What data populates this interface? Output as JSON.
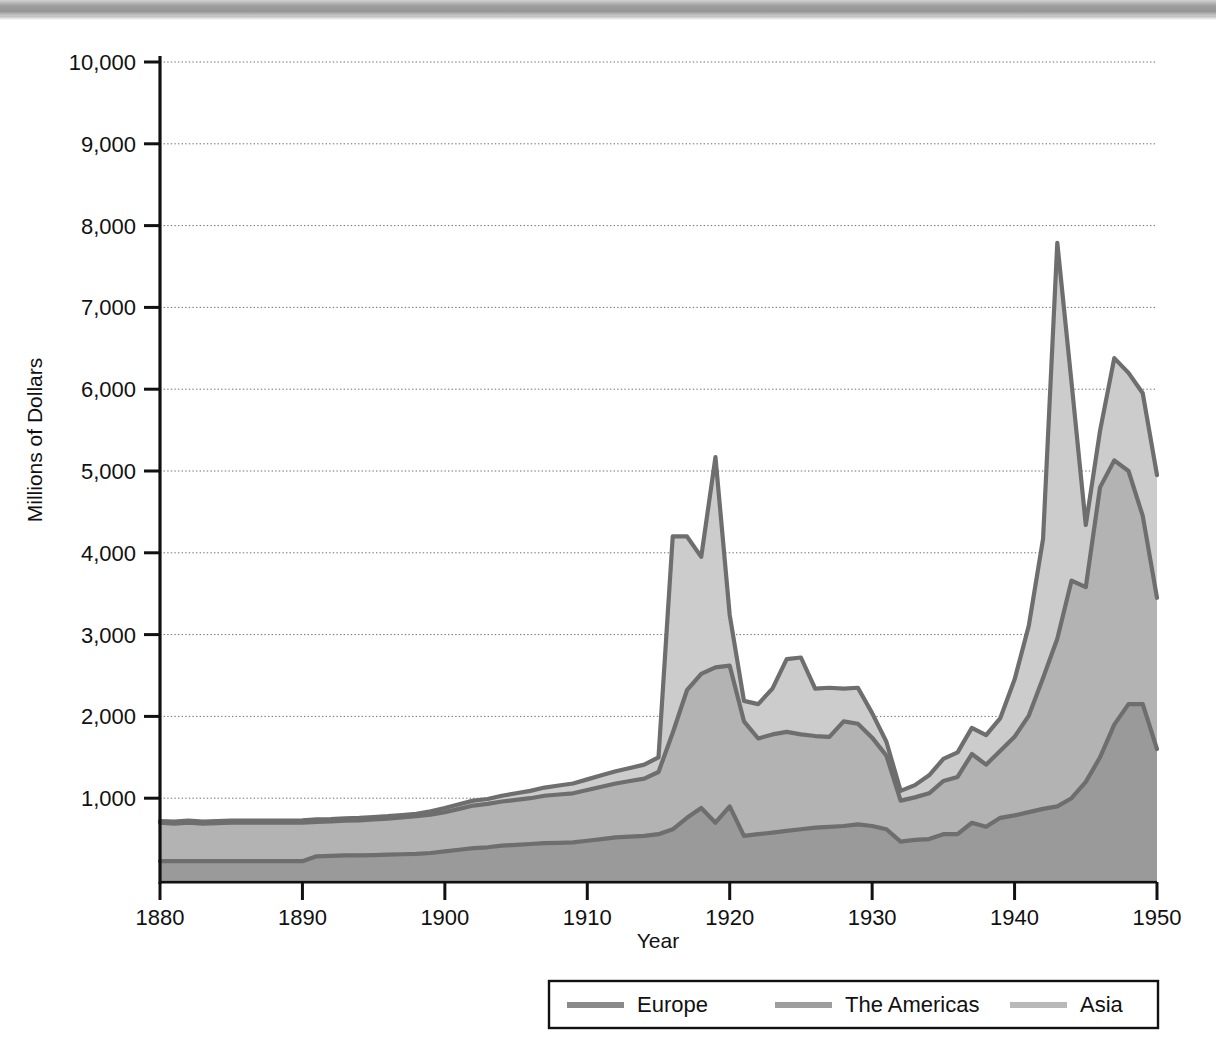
{
  "figure": {
    "type": "stacked-area-chart",
    "scan_artifact": "gray-scan-bar"
  },
  "axes": {
    "y_title": "Millions of Dollars",
    "x_title": "Year",
    "y_ticks": [
      "1,000",
      "2,000",
      "3,000",
      "4,000",
      "5,000",
      "6,000",
      "7,000",
      "8,000",
      "9,000",
      "10,000"
    ],
    "x_ticks": [
      "1880",
      "1890",
      "1900",
      "1910",
      "1920",
      "1930",
      "1940",
      "1950"
    ]
  },
  "legend": {
    "items": [
      {
        "label": "Europe",
        "color": "#8a8a8a"
      },
      {
        "label": "The Americas",
        "color": "#9e9e9e"
      },
      {
        "label": "Asia",
        "color": "#b9b9b9"
      }
    ]
  },
  "colors": {
    "europe_fill": "#9a9a9a",
    "americas_fill": "#b3b3b3",
    "asia_fill": "#cccccc",
    "line": "#6e6e6e",
    "axis": "#111111",
    "grid": "#6f6f6f"
  },
  "chart_data": {
    "type": "area",
    "title": "",
    "subtitle": "",
    "xlabel": "Year",
    "ylabel": "Millions of Dollars",
    "stacked": true,
    "grid": true,
    "legend_position": "bottom",
    "xlim": [
      1880,
      1950
    ],
    "ylim": [
      0,
      10000
    ],
    "ytick_interval": 1000,
    "xtick_interval": 10,
    "x": [
      1880,
      1881,
      1882,
      1883,
      1884,
      1885,
      1886,
      1887,
      1888,
      1889,
      1890,
      1891,
      1892,
      1893,
      1894,
      1895,
      1896,
      1897,
      1898,
      1899,
      1900,
      1901,
      1902,
      1903,
      1904,
      1905,
      1906,
      1907,
      1908,
      1909,
      1910,
      1911,
      1912,
      1913,
      1914,
      1915,
      1916,
      1917,
      1918,
      1919,
      1920,
      1921,
      1922,
      1923,
      1924,
      1925,
      1926,
      1927,
      1928,
      1929,
      1930,
      1931,
      1932,
      1933,
      1934,
      1935,
      1936,
      1937,
      1938,
      1939,
      1940,
      1941,
      1942,
      1943,
      1944,
      1945,
      1946,
      1947,
      1948,
      1949,
      1950
    ],
    "series": [
      {
        "name": "Europe",
        "stack_order": 1,
        "values": [
          230,
          230,
          230,
          230,
          230,
          230,
          230,
          230,
          230,
          230,
          230,
          290,
          295,
          300,
          300,
          305,
          310,
          315,
          320,
          330,
          350,
          370,
          390,
          400,
          420,
          430,
          440,
          450,
          455,
          460,
          480,
          500,
          520,
          530,
          540,
          560,
          620,
          760,
          880,
          700,
          900,
          540,
          560,
          580,
          600,
          620,
          640,
          650,
          660,
          680,
          660,
          620,
          470,
          490,
          500,
          560,
          560,
          700,
          650,
          760,
          790,
          830,
          870,
          900,
          1000,
          1200,
          1500,
          1900,
          2150,
          2150,
          1600
        ]
      },
      {
        "name": "The Americas",
        "stack_order": 2,
        "values": [
          470,
          460,
          470,
          460,
          465,
          470,
          470,
          470,
          470,
          470,
          470,
          420,
          420,
          425,
          430,
          435,
          440,
          450,
          460,
          470,
          480,
          500,
          520,
          530,
          540,
          550,
          560,
          580,
          590,
          600,
          620,
          640,
          660,
          680,
          700,
          760,
          1180,
          1560,
          1640,
          1900,
          1720,
          1400,
          1170,
          1200,
          1210,
          1160,
          1120,
          1100,
          1280,
          1230,
          1080,
          900,
          500,
          520,
          560,
          650,
          700,
          840,
          760,
          820,
          960,
          1180,
          1600,
          2050,
          2660,
          2380,
          3300,
          3230,
          2850,
          2300,
          1850
        ]
      },
      {
        "name": "Asia",
        "stack_order": 3,
        "values": [
          20,
          25,
          25,
          25,
          25,
          25,
          25,
          25,
          25,
          25,
          30,
          30,
          30,
          30,
          30,
          30,
          30,
          30,
          30,
          40,
          50,
          55,
          60,
          60,
          70,
          80,
          90,
          100,
          110,
          120,
          130,
          140,
          150,
          160,
          170,
          180,
          2400,
          1880,
          1430,
          2570,
          620,
          250,
          420,
          560,
          890,
          940,
          580,
          600,
          400,
          440,
          300,
          170,
          120,
          150,
          220,
          270,
          300,
          320,
          360,
          400,
          700,
          1100,
          1700,
          4840,
          2420,
          760,
          690,
          1250,
          1200,
          1500,
          1500
        ]
      }
    ],
    "totals": [
      720,
      715,
      725,
      715,
      720,
      725,
      725,
      725,
      725,
      725,
      730,
      740,
      745,
      755,
      760,
      770,
      780,
      795,
      810,
      840,
      880,
      925,
      970,
      990,
      1030,
      1060,
      1090,
      1130,
      1155,
      1180,
      1230,
      1280,
      1330,
      1370,
      1410,
      1500,
      4200,
      4200,
      3950,
      5170,
      3240,
      2190,
      2150,
      2340,
      2700,
      2720,
      2340,
      2350,
      2340,
      2350,
      2040,
      1690,
      1090,
      1160,
      1280,
      1480,
      1560,
      1860,
      1770,
      1980,
      2450,
      3110,
      4170,
      7790,
      9400,
      4340,
      6300,
      5430,
      5300,
      5950,
      4950
    ],
    "annotations": [
      {
        "text": "WWI peak",
        "x": 1919,
        "y": 5170,
        "rendered": false
      },
      {
        "text": "WWII peak",
        "x": 1943,
        "y": 9400,
        "rendered": false
      }
    ]
  }
}
